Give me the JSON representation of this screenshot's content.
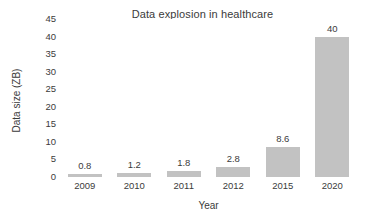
{
  "chart_data": {
    "type": "bar",
    "title": "Data explosion in healthcare",
    "xlabel": "Year",
    "ylabel": "Data size (ZB)",
    "categories": [
      "2009",
      "2010",
      "2011",
      "2012",
      "2015",
      "2020"
    ],
    "values": [
      0.8,
      1.2,
      1.8,
      2.8,
      8.6,
      40
    ],
    "value_labels": [
      "0.8",
      "1.2",
      "1.8",
      "2.8",
      "8.6",
      "40"
    ],
    "ylim": [
      0,
      45
    ],
    "ytick_labels": [
      "45",
      "40",
      "35",
      "30",
      "25",
      "20",
      "15",
      "10",
      "5",
      "0"
    ],
    "ytick_values": [
      45,
      40,
      35,
      30,
      25,
      20,
      15,
      10,
      5,
      0
    ],
    "grid": false,
    "legend": false,
    "bar_color": "#c2c2c2",
    "text_color": "#3b3b3b",
    "background_color": "#ffffff"
  }
}
